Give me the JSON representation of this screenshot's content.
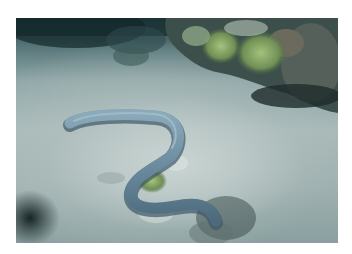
{
  "image": {
    "subject": "eel on sandy seabed",
    "description": "Underwater photo of a long grey-blue eel curving in an S-shape across a pale sandy seabed, with green coral and dark rocks along the upper right edge",
    "colors": {
      "background": "#ffffff",
      "sand": "#a9bab9",
      "water_dark": "#1f3a3e",
      "eel": "#6f8fa3",
      "coral": "#8fae6a",
      "rock": "#3e4f4c"
    }
  }
}
